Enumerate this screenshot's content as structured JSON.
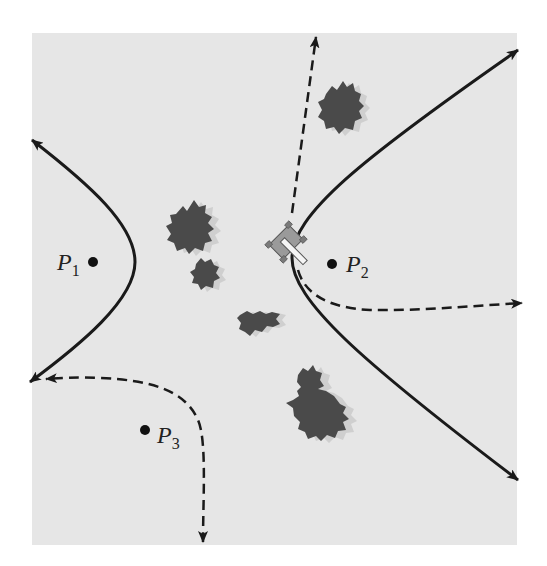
{
  "figure": {
    "background_color": "#ffffff",
    "field_color": "#e6e6e6",
    "curve_color": "#1a1a1a",
    "bush_color": "#4a4a4a",
    "bush_shadow_color": "#cfcfcf",
    "tank_color": "#9a9a9a"
  },
  "points": [
    {
      "id": "P1",
      "letter": "P",
      "subscript": "1"
    },
    {
      "id": "P2",
      "letter": "P",
      "subscript": "2"
    },
    {
      "id": "P3",
      "letter": "P",
      "subscript": "3"
    }
  ],
  "curves": [
    {
      "name": "left-hyperbola-branch",
      "style": "solid"
    },
    {
      "name": "right-hyperbola-branch",
      "style": "solid"
    },
    {
      "name": "dashed-path-up",
      "style": "dashed"
    },
    {
      "name": "dashed-path-right",
      "style": "dashed"
    },
    {
      "name": "dashed-path-left-down",
      "style": "dashed"
    }
  ],
  "objects": [
    {
      "name": "tank",
      "icon": "tank-icon"
    },
    {
      "name": "bushes",
      "count": 5
    }
  ]
}
